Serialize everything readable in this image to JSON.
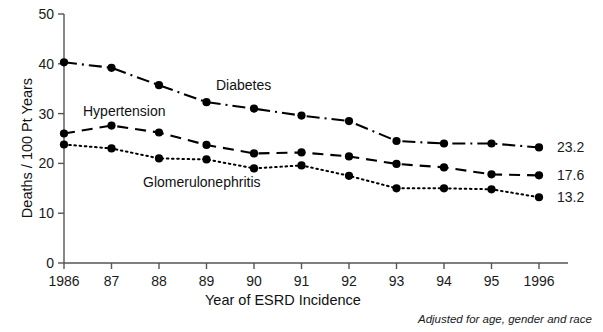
{
  "chart_data": {
    "type": "line",
    "title": "",
    "xlabel": "Year of ESRD Incidence",
    "ylabel": "Deaths / 100 Pt Years",
    "categories": [
      "1986",
      "87",
      "88",
      "89",
      "90",
      "91",
      "92",
      "93",
      "94",
      "95",
      "1996"
    ],
    "x_values": [
      1986,
      1987,
      1988,
      1989,
      1990,
      1991,
      1992,
      1993,
      1994,
      1995,
      1996
    ],
    "ylim": [
      0,
      50
    ],
    "y_ticks": [
      0,
      10,
      20,
      30,
      40,
      50
    ],
    "grid": false,
    "legend_position": "inline-annotations",
    "series": [
      {
        "name": "Diabetes",
        "line_style": "dash-dot",
        "marker": "filled-circle",
        "end_label": "23.2",
        "values": [
          40.3,
          39.2,
          35.7,
          32.3,
          31.0,
          29.6,
          28.5,
          24.5,
          24.0,
          24.0,
          23.2
        ]
      },
      {
        "name": "Hypertension",
        "line_style": "dashed",
        "marker": "filled-circle",
        "end_label": "17.6",
        "values": [
          26.0,
          27.6,
          26.2,
          23.7,
          22.0,
          22.2,
          21.4,
          19.9,
          19.2,
          17.8,
          17.6
        ]
      },
      {
        "name": "Glomerulonephritis",
        "line_style": "dotted",
        "marker": "filled-circle",
        "end_label": "13.2",
        "values": [
          23.8,
          23.0,
          21.0,
          20.8,
          19.0,
          19.6,
          17.5,
          15.0,
          15.0,
          14.8,
          13.2
        ]
      }
    ],
    "annotations": [
      {
        "text": "Adjusted for age, gender and race",
        "style": "italic",
        "position": "bottom-right"
      }
    ],
    "colors": {
      "line": "#000000",
      "marker": "#000000",
      "axis": "#555555",
      "text": "#111111"
    }
  }
}
